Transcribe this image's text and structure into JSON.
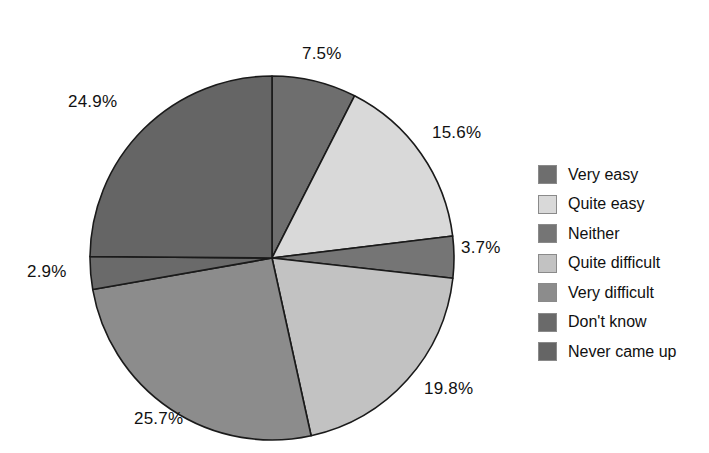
{
  "chart_data": {
    "type": "pie",
    "title": "",
    "subtitle": "",
    "xlabel": "",
    "ylabel": "",
    "legend_position": "right",
    "grid": false,
    "units": "percent",
    "start_angle_deg": 0,
    "direction": "clockwise",
    "categories": [
      "Very easy",
      "Quite easy",
      "Neither",
      "Quite difficult",
      "Very difficult",
      "Don't know",
      "Never came up"
    ],
    "values": [
      7.5,
      15.6,
      3.7,
      19.8,
      25.7,
      2.9,
      24.9
    ],
    "value_labels": [
      "7.5%",
      "15.6%",
      "3.7%",
      "19.8%",
      "25.7%",
      "2.9%",
      "24.9%"
    ],
    "colors": [
      "#6e6e6e",
      "#d9d9d9",
      "#757575",
      "#c2c2c2",
      "#8c8c8c",
      "#6a6a6a",
      "#656565"
    ],
    "slices": [
      {
        "label": "Very easy",
        "value": 7.5,
        "value_label": "7.5%",
        "color": "#6e6e6e"
      },
      {
        "label": "Quite easy",
        "value": 15.6,
        "value_label": "15.6%",
        "color": "#d9d9d9"
      },
      {
        "label": "Neither",
        "value": 3.7,
        "value_label": "3.7%",
        "color": "#757575"
      },
      {
        "label": "Quite difficult",
        "value": 19.8,
        "value_label": "19.8%",
        "color": "#c2c2c2"
      },
      {
        "label": "Very difficult",
        "value": 25.7,
        "value_label": "25.7%",
        "color": "#8c8c8c"
      },
      {
        "label": "Don't know",
        "value": 2.9,
        "value_label": "2.9%",
        "color": "#6a6a6a"
      },
      {
        "label": "Never came up",
        "value": 24.9,
        "value_label": "24.9%",
        "color": "#656565"
      }
    ]
  },
  "legend": {
    "items": [
      {
        "label": "Very easy",
        "color": "#6e6e6e"
      },
      {
        "label": "Quite easy",
        "color": "#d9d9d9"
      },
      {
        "label": "Neither",
        "color": "#757575"
      },
      {
        "label": "Quite difficult",
        "color": "#c2c2c2"
      },
      {
        "label": "Very difficult",
        "color": "#8c8c8c"
      },
      {
        "label": "Don't know",
        "color": "#6a6a6a"
      },
      {
        "label": "Never came up",
        "color": "#656565"
      }
    ]
  },
  "labels": {
    "p1": "7.5%",
    "p2": "15.6%",
    "p3": "3.7%",
    "p4": "19.8%",
    "p5": "25.7%",
    "p6": "2.9%",
    "p7": "24.9%"
  }
}
